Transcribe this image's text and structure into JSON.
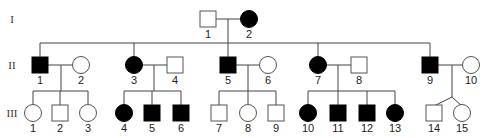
{
  "diagram": {
    "type": "pedigree",
    "generations": [
      {
        "label": "I",
        "y": 19
      },
      {
        "label": "II",
        "y": 65
      },
      {
        "label": "III",
        "y": 113
      }
    ],
    "individuals": [
      {
        "id": "I-1",
        "gen": 0,
        "num": "1",
        "sex": "male",
        "affected": false,
        "x": 208
      },
      {
        "id": "I-2",
        "gen": 0,
        "num": "2",
        "sex": "female",
        "affected": true,
        "x": 249
      },
      {
        "id": "II-1",
        "gen": 1,
        "num": "1",
        "sex": "male",
        "affected": true,
        "x": 40
      },
      {
        "id": "II-2",
        "gen": 1,
        "num": "2",
        "sex": "female",
        "affected": false,
        "x": 81
      },
      {
        "id": "II-3",
        "gen": 1,
        "num": "3",
        "sex": "female",
        "affected": true,
        "x": 134
      },
      {
        "id": "II-4",
        "gen": 1,
        "num": "4",
        "sex": "male",
        "affected": false,
        "x": 175
      },
      {
        "id": "II-5",
        "gen": 1,
        "num": "5",
        "sex": "male",
        "affected": true,
        "x": 228
      },
      {
        "id": "II-6",
        "gen": 1,
        "num": "6",
        "sex": "female",
        "affected": false,
        "x": 268
      },
      {
        "id": "II-7",
        "gen": 1,
        "num": "7",
        "sex": "female",
        "affected": true,
        "x": 318
      },
      {
        "id": "II-8",
        "gen": 1,
        "num": "8",
        "sex": "male",
        "affected": false,
        "x": 359
      },
      {
        "id": "II-9",
        "gen": 1,
        "num": "9",
        "sex": "male",
        "affected": true,
        "x": 430
      },
      {
        "id": "II-10",
        "gen": 1,
        "num": "10",
        "sex": "female",
        "affected": false,
        "x": 471
      },
      {
        "id": "III-1",
        "gen": 2,
        "num": "1",
        "sex": "female",
        "affected": false,
        "x": 33
      },
      {
        "id": "III-2",
        "gen": 2,
        "num": "2",
        "sex": "male",
        "affected": false,
        "x": 60
      },
      {
        "id": "III-3",
        "gen": 2,
        "num": "3",
        "sex": "female",
        "affected": false,
        "x": 88
      },
      {
        "id": "III-4",
        "gen": 2,
        "num": "4",
        "sex": "female",
        "affected": true,
        "x": 124
      },
      {
        "id": "III-5",
        "gen": 2,
        "num": "5",
        "sex": "male",
        "affected": true,
        "x": 152
      },
      {
        "id": "III-6",
        "gen": 2,
        "num": "6",
        "sex": "male",
        "affected": true,
        "x": 181
      },
      {
        "id": "III-7",
        "gen": 2,
        "num": "7",
        "sex": "male",
        "affected": false,
        "x": 219
      },
      {
        "id": "III-8",
        "gen": 2,
        "num": "8",
        "sex": "female",
        "affected": false,
        "x": 248
      },
      {
        "id": "III-9",
        "gen": 2,
        "num": "9",
        "sex": "male",
        "affected": false,
        "x": 276
      },
      {
        "id": "III-10",
        "gen": 2,
        "num": "10",
        "sex": "female",
        "affected": true,
        "x": 308
      },
      {
        "id": "III-11",
        "gen": 2,
        "num": "11",
        "sex": "male",
        "affected": true,
        "x": 338
      },
      {
        "id": "III-12",
        "gen": 2,
        "num": "12",
        "sex": "male",
        "affected": true,
        "x": 367
      },
      {
        "id": "III-13",
        "gen": 2,
        "num": "13",
        "sex": "female",
        "affected": true,
        "x": 395
      },
      {
        "id": "III-14",
        "gen": 2,
        "num": "14",
        "sex": "male",
        "affected": false,
        "x": 434
      },
      {
        "id": "III-15",
        "gen": 2,
        "num": "15",
        "sex": "female",
        "affected": false,
        "x": 462
      }
    ],
    "matings": [
      {
        "a": "I-1",
        "b": "I-2",
        "children": [
          "II-1",
          "II-3",
          "II-5",
          "II-7",
          "II-9"
        ],
        "dropX": 228
      },
      {
        "a": "II-1",
        "b": "II-2",
        "children": [
          "III-1",
          "III-2",
          "III-3"
        ],
        "dropX": 61
      },
      {
        "a": "II-3",
        "b": "II-4",
        "children": [
          "III-4",
          "III-5",
          "III-6"
        ],
        "dropX": 154
      },
      {
        "a": "II-5",
        "b": "II-6",
        "children": [
          "III-7",
          "III-8",
          "III-9"
        ],
        "dropX": 248
      },
      {
        "a": "II-7",
        "b": "II-8",
        "children": [
          "III-10",
          "III-11",
          "III-12",
          "III-13"
        ],
        "dropX": 338
      },
      {
        "a": "II-9",
        "b": "II-10",
        "children": [
          "III-14",
          "III-15"
        ],
        "dropX": 452,
        "twins": true
      }
    ],
    "colors": {
      "affected": "#000000",
      "unaffected": "#ffffff",
      "line": "#444444"
    }
  }
}
